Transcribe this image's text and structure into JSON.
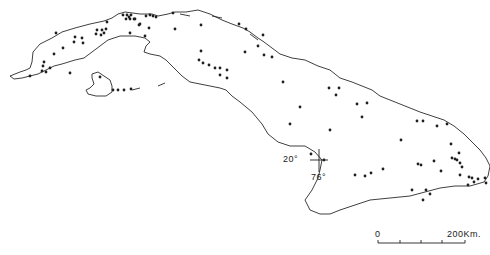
{
  "map": {
    "subject": "Cuba",
    "graticule": {
      "latitude_label": "20°",
      "longitude_label": "76°"
    },
    "scale_bar": {
      "start_label": "0",
      "end_label": "200Km."
    },
    "ink_color": "#222222",
    "dots": [
      [
        123,
        15
      ],
      [
        127,
        15
      ],
      [
        129,
        17
      ],
      [
        131,
        15
      ],
      [
        135,
        19
      ],
      [
        146,
        16
      ],
      [
        150,
        15
      ],
      [
        153,
        16
      ],
      [
        156,
        17
      ],
      [
        126,
        19
      ],
      [
        130,
        19
      ],
      [
        134,
        19
      ],
      [
        173,
        13
      ],
      [
        107,
        22
      ],
      [
        97,
        30
      ],
      [
        102,
        30
      ],
      [
        104,
        33
      ],
      [
        106,
        29
      ],
      [
        96,
        34
      ],
      [
        101,
        35
      ],
      [
        75,
        37
      ],
      [
        82,
        38
      ],
      [
        74,
        42
      ],
      [
        83,
        43
      ],
      [
        63,
        48
      ],
      [
        56,
        33
      ],
      [
        54,
        54
      ],
      [
        44,
        62
      ],
      [
        43,
        66
      ],
      [
        50,
        68
      ],
      [
        42,
        71
      ],
      [
        46,
        72
      ],
      [
        70,
        73
      ],
      [
        30,
        76
      ],
      [
        100,
        77
      ],
      [
        139,
        25
      ],
      [
        145,
        36
      ],
      [
        140,
        24
      ],
      [
        130,
        33
      ],
      [
        149,
        28
      ],
      [
        175,
        29
      ],
      [
        201,
        25
      ],
      [
        201,
        51
      ],
      [
        199,
        60
      ],
      [
        203,
        63
      ],
      [
        209,
        65
      ],
      [
        215,
        68
      ],
      [
        220,
        68
      ],
      [
        227,
        70
      ],
      [
        220,
        75
      ],
      [
        227,
        78
      ],
      [
        113,
        90
      ],
      [
        118,
        90
      ],
      [
        124,
        90
      ],
      [
        131,
        89
      ],
      [
        239,
        24
      ],
      [
        246,
        29
      ],
      [
        263,
        35
      ],
      [
        258,
        46
      ],
      [
        264,
        55
      ],
      [
        245,
        52
      ],
      [
        272,
        57
      ],
      [
        283,
        82
      ],
      [
        300,
        107
      ],
      [
        290,
        124
      ],
      [
        311,
        154
      ],
      [
        324,
        160
      ],
      [
        357,
        104
      ],
      [
        367,
        103
      ],
      [
        362,
        117
      ],
      [
        330,
        130
      ],
      [
        355,
        175
      ],
      [
        365,
        176
      ],
      [
        371,
        173
      ],
      [
        418,
        164
      ],
      [
        421,
        165
      ],
      [
        412,
        190
      ],
      [
        423,
        200
      ],
      [
        426,
        190
      ],
      [
        452,
        158
      ],
      [
        455,
        159
      ],
      [
        457,
        160
      ],
      [
        460,
        163
      ],
      [
        462,
        167
      ],
      [
        441,
        171
      ],
      [
        460,
        175
      ],
      [
        469,
        177
      ],
      [
        472,
        178
      ],
      [
        478,
        179
      ],
      [
        474,
        182
      ],
      [
        468,
        185
      ],
      [
        486,
        183
      ],
      [
        485,
        178
      ],
      [
        401,
        140
      ],
      [
        383,
        169
      ],
      [
        417,
        121
      ],
      [
        423,
        121
      ],
      [
        437,
        126
      ],
      [
        451,
        144
      ],
      [
        447,
        124
      ],
      [
        339,
        88
      ],
      [
        329,
        88
      ],
      [
        336,
        95
      ],
      [
        434,
        161
      ],
      [
        430,
        194
      ],
      [
        459,
        153
      ]
    ]
  }
}
